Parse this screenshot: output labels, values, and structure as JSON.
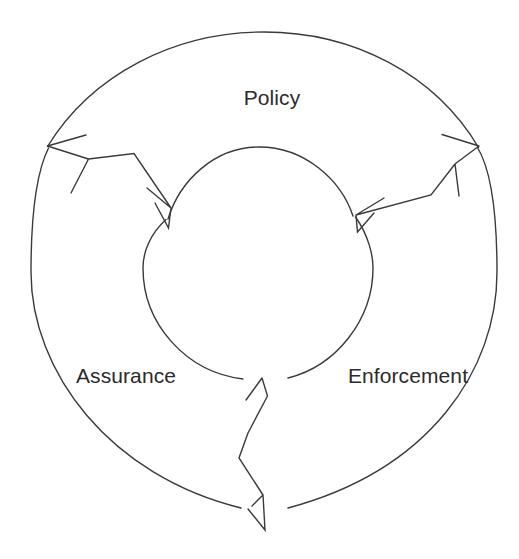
{
  "diagram": {
    "type": "cyclical-annulus-diagram",
    "background_color": "#ffffff",
    "stroke_color": "#3a3a3a",
    "text_color": "#2b2b2b",
    "segments": [
      {
        "id": "policy",
        "label": "Policy",
        "label_x": 272,
        "label_y": 98,
        "position": "top"
      },
      {
        "id": "enforcement",
        "label": "Enforcement",
        "label_x": 408,
        "label_y": 377,
        "position": "bottom-right"
      },
      {
        "id": "assurance",
        "label": "Assurance",
        "label_x": 126,
        "label_y": 377,
        "position": "bottom-left"
      }
    ],
    "outer_circle": {
      "cx": 264,
      "cy": 272,
      "rx": 233,
      "ry": 240
    },
    "inner_circle": {
      "cx": 258,
      "cy": 264,
      "rx": 115,
      "ry": 117
    },
    "dividers": [
      {
        "id": "divider-upper-left",
        "name": "arrow-divider-upper-left",
        "outer_tip_x": 47,
        "outer_tip_y": 146,
        "inner_tip_x": 168,
        "inner_tip_y": 218
      },
      {
        "id": "divider-upper-right",
        "name": "arrow-divider-upper-right",
        "outer_tip_x": 478,
        "outer_tip_y": 147,
        "inner_tip_x": 355,
        "inner_tip_y": 216
      },
      {
        "id": "divider-bottom",
        "name": "arrow-divider-bottom",
        "outer_tip_x": 263,
        "outer_tip_y": 530,
        "inner_tip_x": 262,
        "inner_tip_y": 378
      }
    ]
  }
}
